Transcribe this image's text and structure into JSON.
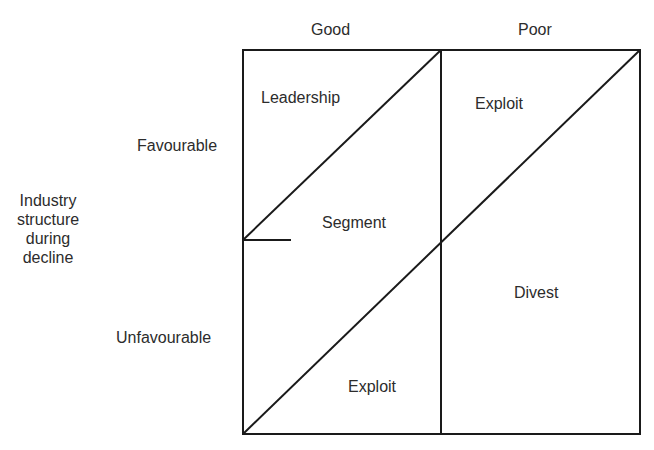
{
  "diagram": {
    "type": "strategy-matrix",
    "columns": {
      "labels": [
        "Good",
        "Poor"
      ]
    },
    "rows": {
      "title": "Industry structure during decline",
      "title_lines": [
        "Industry",
        "structure",
        "during",
        "decline"
      ],
      "labels": [
        "Favourable",
        "Unfavourable"
      ]
    },
    "regions": {
      "leadership": "Leadership",
      "segment": "Segment",
      "exploit_top": "Exploit",
      "exploit_bottom": "Exploit",
      "divest": "Divest"
    },
    "colors": {
      "line": "#1a1a1a",
      "text": "#2c2c2c",
      "background": "#ffffff"
    }
  }
}
